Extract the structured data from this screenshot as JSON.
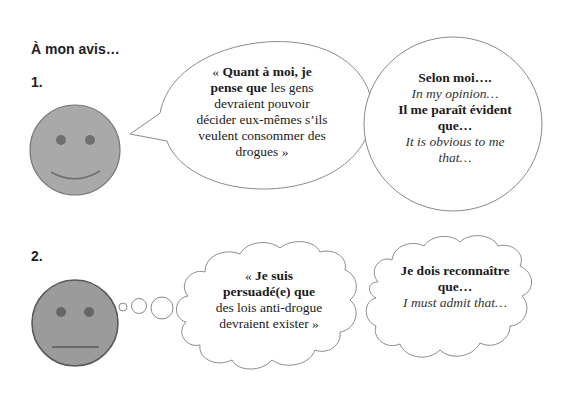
{
  "heading": "À mon avis…",
  "sections": [
    {
      "number": "1.",
      "face": {
        "expression": "smile",
        "fill": "#a9a9a9",
        "stroke": "#7a7a7a",
        "feature_color": "#6f6f6f"
      },
      "speech_bubble": {
        "open_quote": "« ",
        "bold": "Quant à moi, je pense que",
        "rest": " les gens devraient pouvoir décider eux-mêmes s’ils veulent consommer des drogues »"
      },
      "phrase_bubble": {
        "line1_bold": "Selon moi….",
        "line2_italic": "In my opinion…",
        "line3_bold": "Il me paraît évident que…",
        "line4_italic": "It is obvious to me that…"
      }
    },
    {
      "number": "2.",
      "face": {
        "expression": "neutral",
        "fill": "#9b9b9b",
        "stroke": "#5a5a5a",
        "feature_color": "#666666"
      },
      "thought_bubble": {
        "open_quote": "« ",
        "bold": "Je suis persuadé(e) que",
        "rest": " des lois anti-drogue devraient exister »"
      },
      "phrase_bubble": {
        "line1_bold": "Je dois reconnaître que…",
        "line2_italic": "I must admit that…"
      }
    }
  ],
  "colors": {
    "outline": "#8a8a8a",
    "text": "#1a1a1a"
  }
}
